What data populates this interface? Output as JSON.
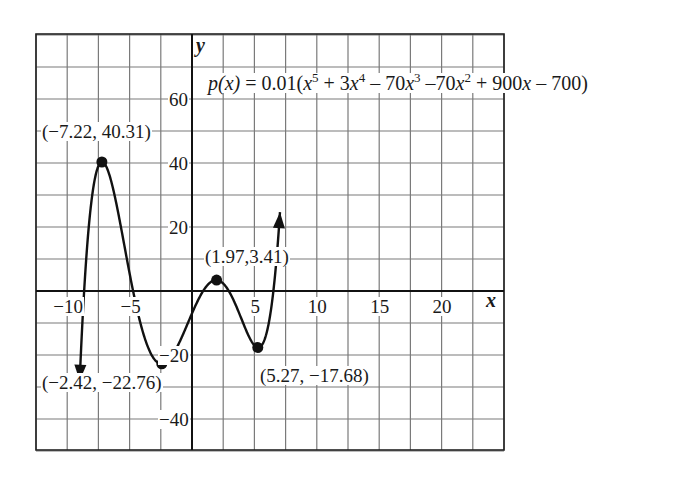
{
  "chart_data": {
    "type": "line",
    "title": "",
    "equation": {
      "lhs": "p(x)",
      "equals": "=",
      "coef": "0.01(",
      "terms": [
        {
          "base": "x",
          "exp": "5",
          "sign": ""
        },
        {
          "sign": " + 3",
          "base": "x",
          "exp": "4"
        },
        {
          "sign": " – 70",
          "base": "x",
          "exp": "3"
        },
        {
          "sign": " –70",
          "base": "x",
          "exp": "2"
        },
        {
          "sign": " + 900",
          "base": "x",
          "exp": ""
        },
        {
          "sign": " – 700)",
          "base": "",
          "exp": ""
        }
      ],
      "full_text": "p(x) = 0.01(x^5 + 3x^4 – 70x^3 –70x^2 + 900x – 700)"
    },
    "polynomial_coefficients": [
      1,
      3,
      -70,
      -70,
      900,
      -700
    ],
    "scale": 0.01,
    "xlabel": "x",
    "ylabel": "y",
    "xlim": [
      -12.5,
      25
    ],
    "ylim": [
      -50,
      80
    ],
    "grid": true,
    "x_grid_step": 2.5,
    "y_grid_step": 10,
    "x_ticks": [
      {
        "value": -10,
        "label": "−10"
      },
      {
        "value": -5,
        "label": "−5"
      },
      {
        "value": 5,
        "label": "5"
      },
      {
        "value": 10,
        "label": "10"
      },
      {
        "value": 15,
        "label": "15"
      },
      {
        "value": 20,
        "label": "20"
      }
    ],
    "y_ticks": [
      {
        "value": 60,
        "label": "60"
      },
      {
        "value": 40,
        "label": "40"
      },
      {
        "value": 20,
        "label": "20"
      },
      {
        "value": -20,
        "label": "−20"
      },
      {
        "value": -40,
        "label": "−40"
      }
    ],
    "series": [
      {
        "name": "p(x)",
        "domain": [
          -9.0,
          7.05
        ],
        "arrows": "both-ends"
      }
    ],
    "points": [
      {
        "x": -7.22,
        "y": 40.31,
        "label": "(−7.22, 40.31)"
      },
      {
        "x": -2.42,
        "y": -22.76,
        "label": "(−2.42, −22.76)"
      },
      {
        "x": 1.97,
        "y": 3.41,
        "label": "(1.97,3.41)"
      },
      {
        "x": 5.27,
        "y": -17.68,
        "label": "(5.27, −17.68)"
      }
    ]
  },
  "colors": {
    "curve": "#111111",
    "grid": "#7a7a7a",
    "axis": "#111111",
    "background": "#ffffff"
  }
}
